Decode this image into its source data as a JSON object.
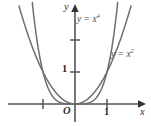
{
  "figure": {
    "background_color": "#ffffff",
    "axis_color": "#555555",
    "curve_color": "#6e6e6e",
    "label_color": "#4a4a4a",
    "tick_color": "#2b2b2b",
    "origin_label": "O",
    "axis_x_label": "x",
    "axis_y_label": "y",
    "tick_labels": {
      "x_one": "1",
      "y_one": "1"
    },
    "curve_labels": {
      "quartic": "y = x",
      "quartic_exponent": "4",
      "quadratic": "y = x",
      "quadratic_exponent": "2"
    }
  },
  "chart_data": {
    "type": "line",
    "title": "",
    "subtitle": "",
    "xlabel": "x",
    "ylabel": "y",
    "xlim": [
      -1.45,
      1.45
    ],
    "ylim": [
      -0.28,
      2.75
    ],
    "grid": false,
    "legend_position": "inline-annotation",
    "xticks": [
      -1,
      1
    ],
    "xtick_labels": [
      "",
      "1"
    ],
    "yticks": [
      1,
      2
    ],
    "ytick_labels": [
      "1",
      ""
    ],
    "annotations": [
      {
        "text": "y = x^4",
        "x": 0.1,
        "y": 2.55,
        "note": "label for the quartic curve, upper middle"
      },
      {
        "text": "y = x^2",
        "x": 1.15,
        "y": 1.72,
        "note": "label for the quadratic curve, right side"
      },
      {
        "text": "O",
        "x": -0.15,
        "y": -0.18,
        "note": "origin label"
      }
    ],
    "series": [
      {
        "name": "y = x^2",
        "equation": "y = x^2",
        "color": "#6e6e6e",
        "x": [
          -1.7,
          -1.6,
          -1.5,
          -1.4,
          -1.3,
          -1.2,
          -1.1,
          -1.0,
          -0.9,
          -0.8,
          -0.7,
          -0.6,
          -0.5,
          -0.4,
          -0.3,
          -0.2,
          -0.1,
          0.0,
          0.1,
          0.2,
          0.3,
          0.4,
          0.5,
          0.6,
          0.7,
          0.8,
          0.9,
          1.0,
          1.1,
          1.2,
          1.3,
          1.4,
          1.5,
          1.6,
          1.7
        ],
        "values": [
          2.89,
          2.56,
          2.25,
          1.96,
          1.69,
          1.44,
          1.21,
          1.0,
          0.81,
          0.64,
          0.49,
          0.36,
          0.25,
          0.16,
          0.09,
          0.04,
          0.01,
          0.0,
          0.01,
          0.04,
          0.09,
          0.16,
          0.25,
          0.36,
          0.49,
          0.64,
          0.81,
          1.0,
          1.21,
          1.44,
          1.69,
          1.96,
          2.25,
          2.56,
          2.89
        ]
      },
      {
        "name": "y = x^4",
        "equation": "y = x^4",
        "color": "#6e6e6e",
        "x": [
          -1.35,
          -1.3,
          -1.25,
          -1.2,
          -1.15,
          -1.1,
          -1.05,
          -1.0,
          -0.9,
          -0.8,
          -0.7,
          -0.6,
          -0.5,
          -0.4,
          -0.3,
          -0.2,
          -0.1,
          0.0,
          0.1,
          0.2,
          0.3,
          0.4,
          0.5,
          0.6,
          0.7,
          0.8,
          0.9,
          1.0,
          1.05,
          1.1,
          1.15,
          1.2,
          1.25,
          1.3,
          1.35
        ],
        "values": [
          3.32,
          2.86,
          2.44,
          2.07,
          1.75,
          1.46,
          1.22,
          1.0,
          0.66,
          0.41,
          0.24,
          0.13,
          0.0625,
          0.0256,
          0.0081,
          0.0016,
          0.0001,
          0.0,
          0.0001,
          0.0016,
          0.0081,
          0.0256,
          0.0625,
          0.13,
          0.24,
          0.41,
          0.66,
          1.0,
          1.22,
          1.46,
          1.75,
          2.07,
          2.44,
          2.86,
          3.32
        ]
      }
    ]
  }
}
